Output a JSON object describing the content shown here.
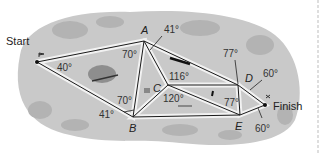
{
  "diagram": {
    "type": "geometry-map",
    "background_color": "#c9c9c9",
    "line_color": "#1a1a1a",
    "highlight_color": "#f4f4f4",
    "points": {
      "start": {
        "label": "Start",
        "x": 37,
        "y": 62
      },
      "A": {
        "label": "A",
        "x": 144,
        "y": 41
      },
      "B": {
        "label": "B",
        "x": 133,
        "y": 117
      },
      "C": {
        "label": "C",
        "x": 168,
        "y": 85
      },
      "D": {
        "label": "D",
        "x": 238,
        "y": 85
      },
      "E": {
        "label": "E",
        "x": 240,
        "y": 115
      },
      "finish": {
        "label": "Finish",
        "x": 265,
        "y": 105
      }
    },
    "segments": [
      [
        "start",
        "A"
      ],
      [
        "start",
        "B"
      ],
      [
        "A",
        "B"
      ],
      [
        "A",
        "C"
      ],
      [
        "B",
        "C"
      ],
      [
        "A",
        "D"
      ],
      [
        "C",
        "D"
      ],
      [
        "C",
        "E"
      ],
      [
        "B",
        "E"
      ],
      [
        "D",
        "E"
      ],
      [
        "D",
        "finish"
      ],
      [
        "E",
        "finish"
      ]
    ],
    "angles": {
      "start": "40°",
      "A_left": "70°",
      "A_right": "41°",
      "B_upper": "70°",
      "B_lower": "41°",
      "C_upper": "116°",
      "C_lower": "120°",
      "D": "77°",
      "E": "77°",
      "D_right": "60°",
      "finish_lower": "60°"
    }
  }
}
